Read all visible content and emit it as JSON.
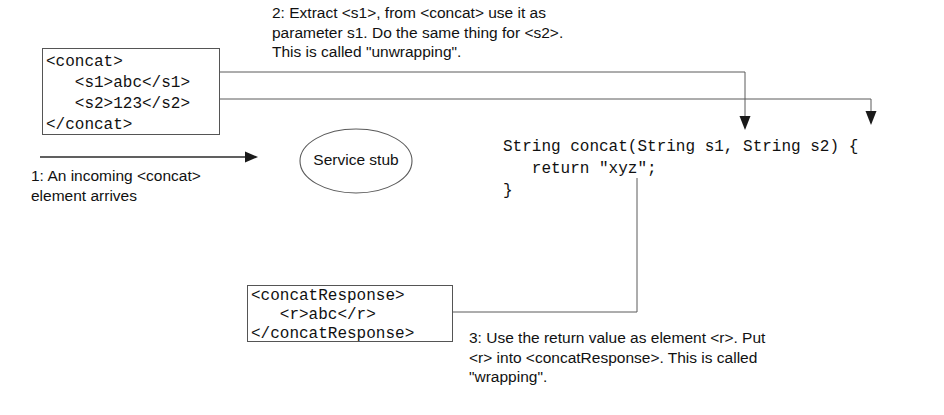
{
  "diagram": {
    "colors": {
      "background": "#ffffff",
      "box_border": "#555555",
      "connector": "#5a5a5a",
      "arrowhead": "#1a1a1a",
      "text": "#111111"
    },
    "request_box": {
      "name": "concat-request-xml",
      "text": "<concat>\n   <s1>abc</s1>\n   <s2>123</s2>\n</concat>"
    },
    "response_box": {
      "name": "concat-response-xml",
      "text": "<concatResponse>\n   <r>abc</r>\n</concatResponse>"
    },
    "service_stub": {
      "label": "Service stub"
    },
    "java_code": {
      "text": "String concat(String s1, String s2) {\n   return \"xyz\";\n}"
    },
    "notes": {
      "step1": "1: An incoming <concat>\nelement arrives",
      "step2": "2: Extract <s1>, from <concat> use it as\nparameter s1. Do the same thing for <s2>.\nThis is called \"unwrapping\".",
      "step3": "3: Use the return value as element <r>. Put\n<r> into <concatResponse>. This is called\n\"wrapping\"."
    }
  }
}
